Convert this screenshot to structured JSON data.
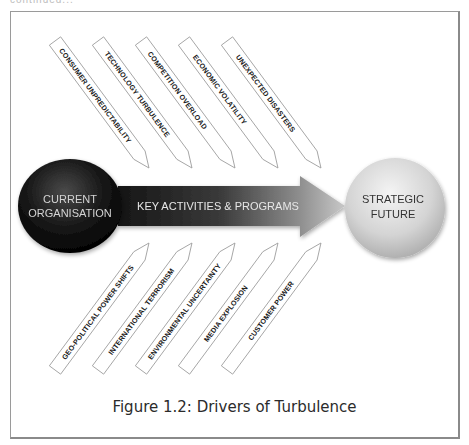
{
  "header": {
    "clipped_text": "continued..."
  },
  "figure": {
    "caption": "Figure 1.2: Drivers of Turbulence",
    "start_node": {
      "line1": "CURRENT",
      "line2": "ORGANISATION",
      "color": "#111111"
    },
    "main_arrow": {
      "label": "KEY ACTIVITIES & PROGRAMS",
      "color_start": "#1c1c1c",
      "color_end": "#b0b0b0"
    },
    "end_node": {
      "line1": "STRATEGIC",
      "line2": "FUTURE",
      "color": "#d9d9d9"
    },
    "drivers_top": [
      {
        "label": "CONSUMER UNPREDICTABILITY"
      },
      {
        "label": "TECHNOLOGY TURBULENCE"
      },
      {
        "label": "COMPETITION OVERLOAD"
      },
      {
        "label": "ECONOMIC VOLATILITY"
      },
      {
        "label": "UNEXPECTED DISASTERS"
      }
    ],
    "drivers_bottom": [
      {
        "label": "GEO-POLITICAL POWER SHIFTS"
      },
      {
        "label": "INTERNATIONAL TERRORISM"
      },
      {
        "label": "ENVIRONMENTAL UNCERTAINTY"
      },
      {
        "label": "MEDIA EXPLOSION"
      },
      {
        "label": "CUSTOMER POWER"
      }
    ]
  }
}
